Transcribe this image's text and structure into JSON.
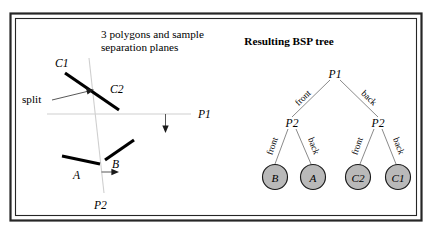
{
  "figure": {
    "left_panel": {
      "title_line1": "3 polygons and sample",
      "title_line2": "separation planes",
      "annotation": "split",
      "polygon_labels": {
        "c1": "C1",
        "c2": "C2",
        "a": "A",
        "b": "B"
      },
      "plane_labels": {
        "p1": "P1",
        "p2": "P2"
      }
    },
    "right_panel": {
      "title": "Resulting BSP tree",
      "root": {
        "label": "P1"
      },
      "internal_nodes": [
        {
          "label": "P2"
        },
        {
          "label": "P2"
        }
      ],
      "leaves": [
        {
          "label": "B"
        },
        {
          "label": "A"
        },
        {
          "label": "C2"
        },
        {
          "label": "C1"
        }
      ],
      "edge_labels": {
        "root_front": "front",
        "root_back": "back",
        "left_front": "front",
        "left_back": "back",
        "right_front": "front",
        "right_back": "back"
      }
    },
    "colors": {
      "node_fill": "#b9b9b9",
      "node_stroke": "#1a1a1a",
      "edge": "#7d7d7d",
      "plane_line": "#cfcfcf",
      "polygon": "#000000",
      "frame": "#262626"
    }
  }
}
